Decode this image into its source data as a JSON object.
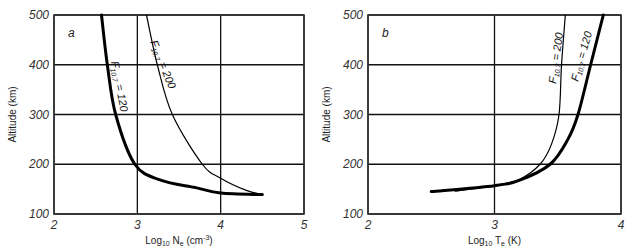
{
  "chart_data": [
    {
      "type": "line",
      "panel_label": "a",
      "title": "",
      "xlabel": "Log10 Ne (cm-3)",
      "xlabel_parts": {
        "main": "Log",
        "sub": "10",
        "var": " N",
        "var_sub": "e",
        "unit": " (cm",
        "unit_sup": "-3",
        "close": ")"
      },
      "ylabel": "Altitude (km)",
      "xlim": [
        2,
        5
      ],
      "ylim": [
        100,
        500
      ],
      "xticks": [
        "2",
        "3",
        "4",
        "5"
      ],
      "yticks": [
        "100",
        "200",
        "300",
        "400",
        "500"
      ],
      "grid": true,
      "series": [
        {
          "name": "F10.7 = 120",
          "label_main": "F",
          "label_sub": "10.7",
          "label_rest": " = 120",
          "style": "thick",
          "points": [
            [
              2.57,
              500
            ],
            [
              2.64,
              400
            ],
            [
              2.74,
              300
            ],
            [
              2.97,
              200
            ],
            [
              3.28,
              168
            ],
            [
              3.7,
              153
            ],
            [
              4.0,
              142
            ],
            [
              4.5,
              139
            ]
          ]
        },
        {
          "name": "F10.7 = 200",
          "label_main": "F",
          "label_sub": "10.7",
          "label_rest": " = 200",
          "style": "thin",
          "points": [
            [
              3.11,
              500
            ],
            [
              3.24,
              400
            ],
            [
              3.42,
              300
            ],
            [
              3.78,
              200
            ],
            [
              4.0,
              172
            ],
            [
              4.3,
              148
            ],
            [
              4.5,
              139
            ]
          ]
        }
      ]
    },
    {
      "type": "line",
      "panel_label": "b",
      "title": "",
      "xlabel": "Log10 Te (K)",
      "xlabel_parts": {
        "main": "Log",
        "sub": "10",
        "var": " T",
        "var_sub": "e",
        "unit": " (K)"
      },
      "ylabel": "Altitude (km)",
      "xlim": [
        2,
        4
      ],
      "ylim": [
        100,
        500
      ],
      "xticks": [
        "2",
        "3",
        "4"
      ],
      "yticks": [
        "100",
        "200",
        "300",
        "400",
        "500"
      ],
      "grid": true,
      "series": [
        {
          "name": "F10.7 = 200",
          "label_main": "F",
          "label_sub": "10.7",
          "label_rest": " = 200",
          "style": "thin",
          "points": [
            [
              2.69,
              146
            ],
            [
              3.0,
              157
            ],
            [
              3.2,
              170
            ],
            [
              3.36,
              200
            ],
            [
              3.45,
              240
            ],
            [
              3.51,
              300
            ],
            [
              3.53,
              400
            ],
            [
              3.56,
              500
            ]
          ]
        },
        {
          "name": "F10.7 = 120",
          "label_main": "F",
          "label_sub": "10.7",
          "label_rest": " = 120",
          "style": "thick",
          "points": [
            [
              2.5,
              145
            ],
            [
              3.0,
              157
            ],
            [
              3.2,
              168
            ],
            [
              3.44,
              200
            ],
            [
              3.58,
              250
            ],
            [
              3.66,
              300
            ],
            [
              3.76,
              400
            ],
            [
              3.86,
              500
            ]
          ]
        }
      ]
    }
  ]
}
